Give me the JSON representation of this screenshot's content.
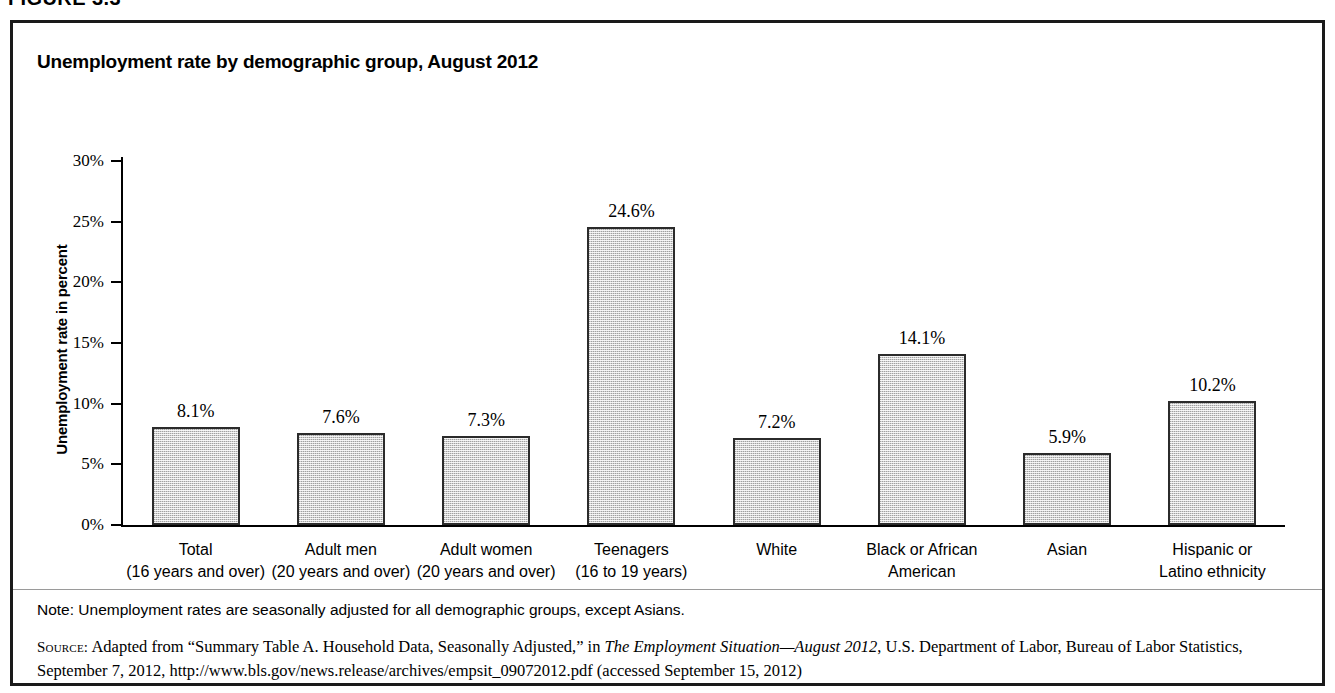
{
  "figure": {
    "label": "FIGURE 3.3",
    "title": "Unemployment rate by demographic group, August 2012"
  },
  "chart_data": {
    "type": "bar",
    "title": "Unemployment rate by demographic group, August 2012",
    "xlabel": "",
    "ylabel": "Unemployment rate in percent",
    "ylim": [
      0,
      30
    ],
    "ytick_labels": [
      "0%",
      "5%",
      "10%",
      "15%",
      "20%",
      "25%",
      "30%"
    ],
    "ytick_values": [
      0,
      5,
      10,
      15,
      20,
      25,
      30
    ],
    "grid": false,
    "legend": false,
    "categories": [
      "Total (16 years and over)",
      "Adult men (20 years and over)",
      "Adult women (20 years and over)",
      "Teenagers (16 to 19 years)",
      "White",
      "Black or African American",
      "Asian",
      "Hispanic or Latino ethnicity"
    ],
    "category_lines": [
      [
        "Total",
        "(16 years and over)"
      ],
      [
        "Adult men",
        "(20 years and over)"
      ],
      [
        "Adult women",
        "(20 years and over)"
      ],
      [
        "Teenagers",
        "(16 to 19 years)"
      ],
      [
        "White",
        ""
      ],
      [
        "Black or African",
        "American"
      ],
      [
        "Asian",
        ""
      ],
      [
        "Hispanic or",
        "Latino ethnicity"
      ]
    ],
    "values": [
      8.1,
      7.6,
      7.3,
      24.6,
      7.2,
      14.1,
      5.9,
      10.2
    ],
    "value_labels": [
      "8.1%",
      "7.6%",
      "7.3%",
      "24.6%",
      "7.2%",
      "14.1%",
      "5.9%",
      "10.2%"
    ],
    "bar_color": "#d2d2d2",
    "bar_border_color": "#2b2b2b"
  },
  "footnotes": {
    "note": "Note: Unemployment rates are seasonally adjusted for all demographic groups, except Asians.",
    "source_prefix": "Source:",
    "source_part1": " Adapted from “Summary Table A. Household Data, Seasonally Adjusted,” in ",
    "source_italic": "The Employment Situation—August 2012",
    "source_part2": ", U.S. Department of Labor, Bureau of Labor Statistics, September 7, 2012, http://www.bls.gov/news.release/archives/empsit_09072012.pdf (accessed September 15, 2012)"
  }
}
